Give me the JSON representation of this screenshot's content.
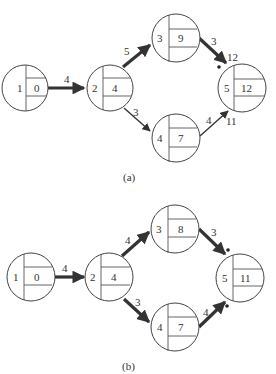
{
  "diagrams": [
    {
      "caption": "(a)",
      "nodes": [
        {
          "id": "1",
          "value": "0"
        },
        {
          "id": "2",
          "value": "4"
        },
        {
          "id": "3",
          "value": "9"
        },
        {
          "id": "4",
          "value": "7"
        },
        {
          "id": "5",
          "value": "12"
        }
      ],
      "edges": [
        {
          "from": "1",
          "to": "2",
          "weight": "4",
          "critical": true
        },
        {
          "from": "2",
          "to": "3",
          "weight": "5",
          "critical": true
        },
        {
          "from": "2",
          "to": "4",
          "weight": "3",
          "critical": false
        },
        {
          "from": "3",
          "to": "5",
          "weight": "3",
          "critical": true
        },
        {
          "from": "4",
          "to": "5",
          "weight": "4",
          "critical": false
        }
      ],
      "annotations": [
        {
          "near": "edge-3-5",
          "text": "12",
          "marker": "dot"
        },
        {
          "near": "edge-4-5",
          "text": "11"
        }
      ]
    },
    {
      "caption": "(b)",
      "nodes": [
        {
          "id": "1",
          "value": "0"
        },
        {
          "id": "2",
          "value": "4"
        },
        {
          "id": "3",
          "value": "8"
        },
        {
          "id": "4",
          "value": "7"
        },
        {
          "id": "5",
          "value": "11"
        }
      ],
      "edges": [
        {
          "from": "1",
          "to": "2",
          "weight": "4",
          "critical": true
        },
        {
          "from": "2",
          "to": "3",
          "weight": "4",
          "critical": true
        },
        {
          "from": "2",
          "to": "4",
          "weight": "3",
          "critical": true
        },
        {
          "from": "3",
          "to": "5",
          "weight": "3",
          "critical": true
        },
        {
          "from": "4",
          "to": "5",
          "weight": "4",
          "critical": true
        }
      ],
      "annotations": [
        {
          "near": "edge-3-5",
          "marker": "dot"
        },
        {
          "near": "edge-4-5",
          "marker": "dot"
        }
      ]
    }
  ]
}
